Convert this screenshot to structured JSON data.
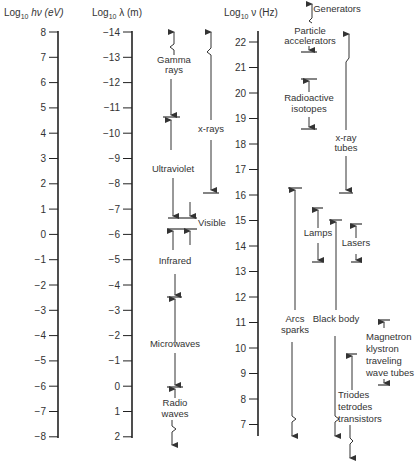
{
  "axes": {
    "energy": {
      "title_prefix": "Log",
      "title_sub": "10",
      "title_suffix": " hν (eV)",
      "ticks": [
        "8",
        "7",
        "6",
        "5",
        "4",
        "3",
        "2",
        "1",
        "0",
        "−1",
        "−2",
        "−3",
        "−4",
        "−5",
        "−6",
        "−7",
        "−8"
      ]
    },
    "wavelength": {
      "title_prefix": "Log",
      "title_sub": "10",
      "title_suffix": " λ (m)",
      "ticks": [
        "−14",
        "−13",
        "−12",
        "−11",
        "−10",
        "−9",
        "−8",
        "−7",
        "−6",
        "−5",
        "−4",
        "−3",
        "−2",
        "−1",
        "0",
        "1",
        "2"
      ]
    },
    "frequency": {
      "title_prefix": "Log",
      "title_sub": "10",
      "title_suffix": " ν (Hz)",
      "ticks": [
        "22",
        "21",
        "20",
        "19",
        "18",
        "17",
        "16",
        "15",
        "14",
        "13",
        "12",
        "11",
        "10",
        "9",
        "8",
        "7"
      ]
    }
  },
  "radiation_types": {
    "gamma": "Gamma",
    "gamma2": "rays",
    "xrays": "x-rays",
    "ultraviolet": "Ultraviolet",
    "visible": "Visible",
    "infrared": "Infrared",
    "microwaves": "Microwaves",
    "radio": "Radio",
    "radio2": "waves"
  },
  "generators": {
    "header": "Generators",
    "particle": "Particle",
    "particle2": "accelerators",
    "radioactive": "Radioactive",
    "radioactive2": "isotopes",
    "xray_tubes": "x-ray",
    "xray_tubes2": "tubes",
    "lamps": "Lamps",
    "lasers": "Lasers",
    "arcs": "Arcs",
    "arcs2": "sparks",
    "blackbody": "Black body",
    "magnetron": "Magnetron",
    "magnetron2": "klystron",
    "magnetron3": "traveling",
    "magnetron4": "wave tubes",
    "triodes": "Triodes",
    "triodes2": "tetrodes",
    "triodes3": "transistors"
  }
}
